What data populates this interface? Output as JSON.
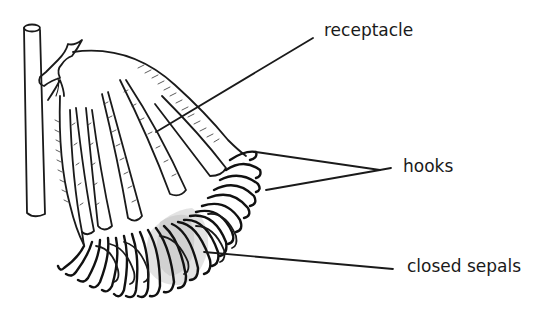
{
  "figure": {
    "ink_color": "#1a1a1a",
    "background": "#ffffff"
  },
  "labels": {
    "receptacle": "receptacle",
    "hooks": "hooks",
    "closed_sepals": "closed sepals"
  }
}
